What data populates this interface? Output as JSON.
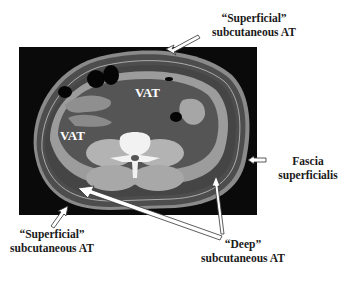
{
  "figure": {
    "type": "CT cross-section (abdomen) with annotations",
    "labels": {
      "superficial_top": {
        "line1": "“Superficial”",
        "line2": "subcutaneous AT"
      },
      "fascia": {
        "line1": "Fascia",
        "line2": "superficialis"
      },
      "superficial_bottom": {
        "line1": "“Superficial”",
        "line2": "subcutaneous AT"
      },
      "deep": {
        "line1": "“Deep”",
        "line2": "subcutaneous AT"
      },
      "vat_upper": "VAT",
      "vat_left": "VAT"
    },
    "colors": {
      "background": "#ffffff",
      "ct_frame": "#0a0a0a",
      "subcutaneous_fat": "#4a4a4a",
      "skin": "#8a8a8a",
      "muscle": "#9c9c9c",
      "visceral_fat": "#555555",
      "bone": "#f2f2f2",
      "bowel_gas": "#050505",
      "text": "#1a1a1a"
    }
  }
}
